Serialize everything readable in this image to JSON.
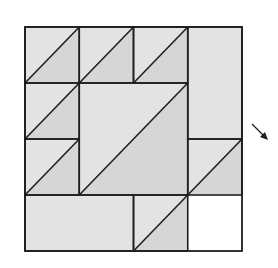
{
  "diagram": {
    "grid_units": 4,
    "colors": {
      "light_fill": "#e3e3e3",
      "dark_fill": "#d6d6d6",
      "line": "#1e1e1e",
      "background": "#ffffff"
    },
    "pieces": [
      {
        "name": "top-row-triangle-1",
        "cells": [
          0,
          0,
          1,
          1
        ],
        "type": "half-square"
      },
      {
        "name": "top-row-triangle-2",
        "cells": [
          1,
          0,
          1,
          1
        ],
        "type": "half-square"
      },
      {
        "name": "top-row-triangle-3",
        "cells": [
          2,
          0,
          1,
          1
        ],
        "type": "half-square"
      },
      {
        "name": "right-column-rect",
        "cells": [
          3,
          0,
          1,
          2
        ],
        "type": "plain"
      },
      {
        "name": "left-column-triangle-1",
        "cells": [
          0,
          1,
          1,
          1
        ],
        "type": "half-square"
      },
      {
        "name": "left-column-triangle-2",
        "cells": [
          0,
          2,
          1,
          1
        ],
        "type": "half-square"
      },
      {
        "name": "center-square",
        "cells": [
          1,
          1,
          2,
          2
        ],
        "type": "half-square"
      },
      {
        "name": "right-lower-triangle",
        "cells": [
          3,
          2,
          1,
          1
        ],
        "type": "half-square-open"
      },
      {
        "name": "bottom-left-rect",
        "cells": [
          0,
          3,
          2,
          1
        ],
        "type": "plain"
      },
      {
        "name": "bottom-right-triangle",
        "cells": [
          2,
          3,
          1,
          1
        ],
        "type": "half-square-open"
      }
    ],
    "arrow_icon": "arrow-down-right"
  }
}
